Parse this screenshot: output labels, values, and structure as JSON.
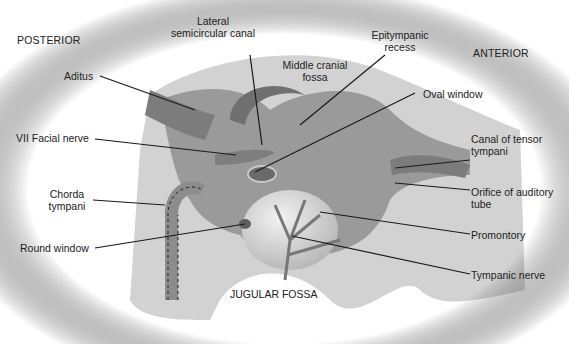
{
  "diagram": {
    "orientation": {
      "left": "POSTERIOR",
      "right": "ANTERIOR"
    },
    "region_label": "JUGULAR FOSSA",
    "labels": {
      "lateral_semicircular_canal": [
        "Lateral",
        "semicircular canal"
      ],
      "epitympanic_recess": [
        "Epitympanic",
        "recess"
      ],
      "middle_cranial_fossa": [
        "Middle cranial",
        "fossa"
      ],
      "aditus": "Aditus",
      "oval_window": "Oval window",
      "facial_nerve": "VII Facial nerve",
      "canal_tensor_tympani": [
        "Canal of tensor",
        "tympani"
      ],
      "chorda_tympani": [
        "Chorda",
        "tympani"
      ],
      "orifice_auditory_tube": [
        "Orifice of auditory",
        "tube"
      ],
      "round_window": "Round window",
      "promontory": "Promontory",
      "tympanic_nerve": "Tympanic nerve"
    },
    "colors": {
      "bone": "#d2d2d2",
      "cavity": "#9a9a9a",
      "dark": "#6e6e6e",
      "leader": "#1a1a1a"
    }
  }
}
